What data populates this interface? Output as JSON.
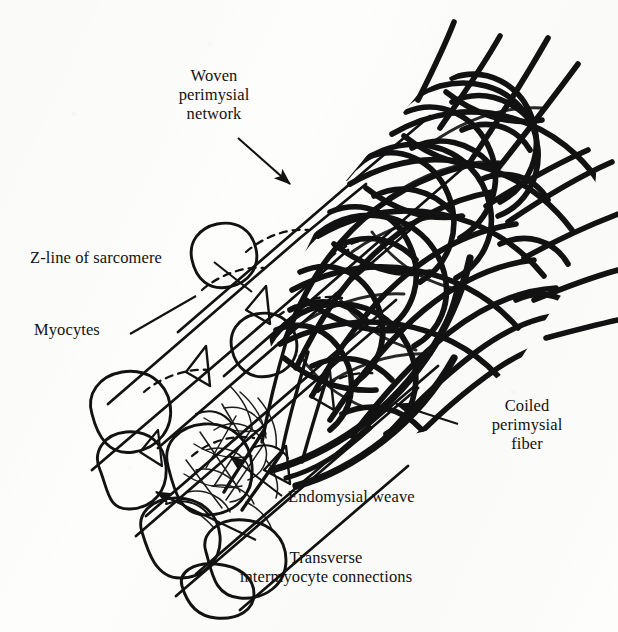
{
  "figure": {
    "kind": "anatomical-line-drawing",
    "background_color": "#fdfdfc",
    "ink_color": "#121212"
  },
  "labels": [
    {
      "id": "woven-perimysial-network",
      "lines": [
        "Woven",
        "perimysial",
        "network"
      ],
      "text": "Woven\nperimysial\nnetwork",
      "align": "center",
      "x": 152,
      "y": 66,
      "width": 124,
      "leader": "arrow pointing down-right to network edge"
    },
    {
      "id": "z-line-of-sarcomere",
      "lines": [
        "Z-line of sarcomere"
      ],
      "text": "Z-line of sarcomere",
      "align": "left",
      "x": 30,
      "y": 248,
      "width": 180,
      "leader": "plain line to dashed arc on myocyte"
    },
    {
      "id": "myocytes",
      "lines": [
        "Myocytes"
      ],
      "text": "Myocytes",
      "align": "left",
      "x": 34,
      "y": 320,
      "width": 92,
      "leader": "plain line to myocyte cylinder"
    },
    {
      "id": "coiled-perimysial-fiber",
      "lines": [
        "Coiled",
        "perimysial",
        "fiber"
      ],
      "text": "Coiled\nperimysial\nfiber",
      "align": "center",
      "x": 466,
      "y": 396,
      "width": 122,
      "leader": "arrow pointing up-left to thick coiled fiber"
    },
    {
      "id": "endomysial-weave",
      "lines": [
        "Endomysial weave"
      ],
      "text": "Endomysial weave",
      "align": "left",
      "x": 288,
      "y": 487,
      "width": 164,
      "leader": "arrow pointing up-left to fine mesh"
    },
    {
      "id": "transverse-intermyocyte-connections",
      "lines": [
        "Transverse",
        "intermyocyte connections"
      ],
      "text": "Transverse\nintermyocyte connections",
      "align": "center",
      "x": 198,
      "y": 548,
      "width": 256,
      "leader": "arrow pointing up-left between myocytes"
    }
  ],
  "structures": {
    "myocyte_cylinders": 6,
    "z_line_dashes": 6,
    "perimysial_strand_count": 46,
    "splayed_fiber_ends": 9,
    "coiled_fiber": "thick bold sweeping curve along lower-right border of bundle",
    "endomysial_mesh": "fine thin-line weave between myocytes near lower centre"
  }
}
